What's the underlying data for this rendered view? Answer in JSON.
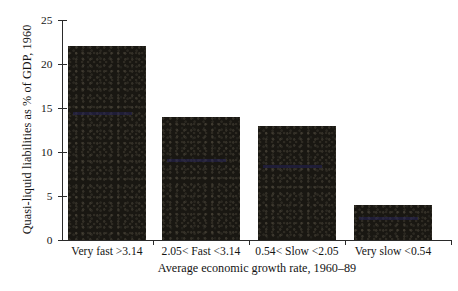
{
  "chart_data": {
    "type": "bar",
    "title": "",
    "subtitle": "",
    "categories": [
      "Very fast >3.14",
      "2.05< Fast <3.14",
      "0.54< Slow <2.05",
      "Very slow <0.54"
    ],
    "values": [
      22,
      14,
      13,
      4
    ],
    "xlabel": "Average economic growth rate, 1960–89",
    "ylabel": "Quasi-liquid liabilities as % of GDP, 1960",
    "ylim": [
      0,
      25
    ],
    "yticks": [
      0,
      5,
      10,
      15,
      20,
      25
    ],
    "ytick_labels": [
      "0",
      "5",
      "10",
      "15",
      "20",
      "25"
    ],
    "grid": false,
    "legend": null,
    "bar_color": "#191712",
    "axis_color": "#2a2a2a",
    "background": "#ffffff"
  }
}
